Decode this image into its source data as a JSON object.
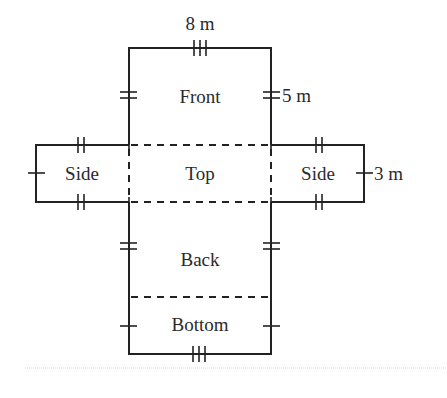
{
  "diagram": {
    "type": "net-of-rectangular-prism",
    "faces": [
      {
        "id": "front",
        "label": "Front"
      },
      {
        "id": "top",
        "label": "Top"
      },
      {
        "id": "side_left",
        "label": "Side"
      },
      {
        "id": "side_right",
        "label": "Side"
      },
      {
        "id": "back",
        "label": "Back"
      },
      {
        "id": "bottom",
        "label": "Bottom"
      }
    ],
    "dimensions": {
      "length": "8 m",
      "height": "5 m",
      "width": "3 m"
    },
    "stroke_color": "#222222",
    "text_color": "#2a2a2a"
  }
}
